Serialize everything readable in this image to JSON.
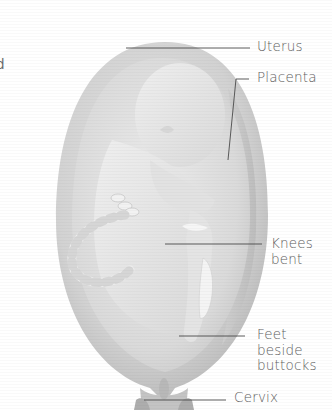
{
  "figure": {
    "colors": {
      "background": "#ffffff",
      "uterus_outer": "#c9c9c9",
      "uterus_inner": "#dcdcdc",
      "fetus": "#e6e6e6",
      "leader_line": "#4a4a4a",
      "label_text": "#5e5e5e"
    },
    "partial_left_text": "d",
    "labels": [
      {
        "id": "uterus",
        "text": "Uterus"
      },
      {
        "id": "placenta",
        "text": "Placenta"
      },
      {
        "id": "knees",
        "text": "Knees\nbent"
      },
      {
        "id": "feet",
        "text": "Feet\nbeside\nbuttocks"
      },
      {
        "id": "cervix",
        "text": "Cervix"
      }
    ]
  }
}
